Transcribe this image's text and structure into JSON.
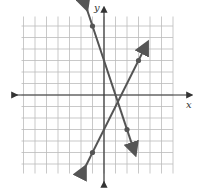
{
  "chart_data": {
    "type": "line",
    "title": "",
    "xlabel": "x",
    "ylabel": "y",
    "xlim": [
      -7,
      6
    ],
    "ylim": [
      -7,
      7
    ],
    "grid": true,
    "series": [
      {
        "name": "line-steep",
        "equation": "y = -3x + 3",
        "points": [
          [
            -1,
            6
          ],
          [
            2,
            -3
          ]
        ],
        "color": "#555555"
      },
      {
        "name": "line-rising",
        "equation": "y = 2x - 3",
        "points": [
          [
            3,
            3
          ],
          [
            -1,
            -5
          ]
        ],
        "color": "#555555"
      }
    ],
    "intersection": [
      1.2,
      -0.6
    ]
  },
  "colors": {
    "grid": "#bbbbbb",
    "axis": "#333333",
    "line": "#555555"
  },
  "labels": {
    "x_axis": "x",
    "y_axis": "y"
  }
}
